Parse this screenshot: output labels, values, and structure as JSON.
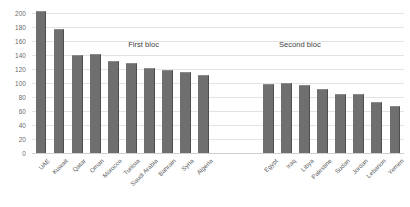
{
  "chart_data": {
    "type": "bar",
    "title": "",
    "xlabel": "",
    "ylabel": "",
    "ylim": [
      0,
      200
    ],
    "ytick_step": 20,
    "yticks": [
      200,
      180,
      160,
      140,
      120,
      100,
      80,
      60,
      40,
      20,
      0
    ],
    "grid": true,
    "legend": "none",
    "bar_color": "#6f6f6f",
    "gridline_color": "#e3e3e3",
    "groups": [
      {
        "name": "First bloc",
        "categories": [
          "UAE",
          "Kuwait",
          "Qatar",
          "Oman",
          "Morocco",
          "Tunisia",
          "Saudi Arabia",
          "Bahrain",
          "Syria",
          "Algeria"
        ],
        "values": [
          203,
          177,
          140,
          141,
          131,
          128,
          121,
          119,
          116,
          112
        ]
      },
      {
        "name": "Second bloc",
        "categories": [
          "Egypt",
          "Iraq",
          "Libya",
          "Palestine",
          "Sudan",
          "Jordan",
          "Lebanon",
          "Yemen"
        ],
        "values": [
          99,
          100,
          97,
          92,
          85,
          85,
          73,
          67
        ]
      }
    ],
    "categories": [
      "UAE",
      "Kuwait",
      "Qatar",
      "Oman",
      "Morocco",
      "Tunisia",
      "Saudi Arabia",
      "Bahrain",
      "Syria",
      "Algeria",
      "Egypt",
      "Iraq",
      "Libya",
      "Palestine",
      "Sudan",
      "Jordan",
      "Lebanon",
      "Yemen"
    ],
    "values": [
      203,
      177,
      140,
      141,
      131,
      128,
      121,
      119,
      116,
      112,
      99,
      100,
      97,
      92,
      85,
      85,
      73,
      67
    ],
    "annotations": [
      {
        "text": "First bloc",
        "x_frac": 0.3,
        "y_value": 162
      },
      {
        "text": "Second bloc",
        "x_frac": 0.72,
        "y_value": 162
      }
    ]
  }
}
